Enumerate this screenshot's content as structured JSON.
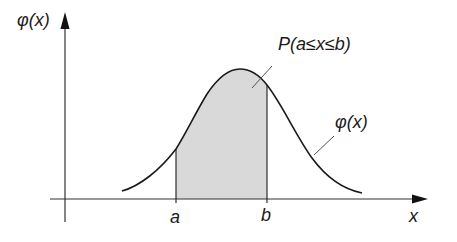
{
  "diagram": {
    "y_axis_label": "φ(x)",
    "x_axis_label": "x",
    "curve_label": "φ(x)",
    "area_label": "P(a≤x≤b)",
    "tick_a": "a",
    "tick_b": "b",
    "colors": {
      "stroke": "#1a1a1a",
      "axis": "#333333",
      "fill": "#d9d9d9",
      "background": "#ffffff"
    }
  }
}
